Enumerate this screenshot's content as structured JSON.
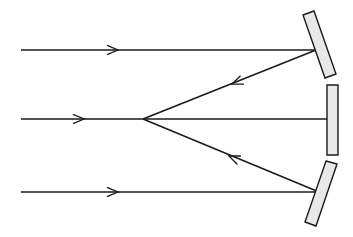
{
  "figure": {
    "background_color": "#ffffff",
    "width": 353,
    "height": 237
  },
  "style": {
    "ray_color": "#1a1a1a",
    "mirror_fill": "#e8e8e8",
    "mirror_stroke": "#1a1a1a",
    "ray_stroke_width": 1.5,
    "mirror_stroke_width": 1.4
  },
  "chart_data": {
    "type": "diagram",
    "focal_point": {
      "x": 143,
      "y": 119
    },
    "incident_rays": [
      {
        "name": "top-incident-ray",
        "x1": 21,
        "y1": 50,
        "x2": 316,
        "y2": 50,
        "arrow_at": {
          "x": 118,
          "y": 50
        },
        "direction": "right"
      },
      {
        "name": "middle-incident-ray",
        "x1": 21,
        "y1": 119,
        "x2": 327,
        "y2": 119,
        "arrow_at": {
          "x": 84,
          "y": 119
        },
        "direction": "right"
      },
      {
        "name": "bottom-incident-ray",
        "x1": 21,
        "y1": 192,
        "x2": 319,
        "y2": 192,
        "arrow_at": {
          "x": 118,
          "y": 192
        },
        "direction": "right"
      }
    ],
    "reflected_rays": [
      {
        "name": "top-reflected-ray",
        "x1": 316,
        "y1": 50,
        "x2": 143,
        "y2": 119,
        "arrow_at": {
          "x": 232,
          "y": 84
        },
        "direction": "left-down"
      },
      {
        "name": "bottom-reflected-ray",
        "x1": 319,
        "y1": 192,
        "x2": 143,
        "y2": 119,
        "arrow_at": {
          "x": 229,
          "y": 156
        },
        "direction": "left-up"
      }
    ],
    "mirror_segments": [
      {
        "name": "top-mirror-segment",
        "orientation": "tilted-left",
        "points": "303,15 314,11 336,74 325,78"
      },
      {
        "name": "middle-mirror-segment",
        "orientation": "vertical",
        "points": "327,85 338,85 338,155 327,155"
      },
      {
        "name": "bottom-mirror-segment",
        "orientation": "tilted-right",
        "points": "326,161 337,164 316,226 305,222"
      }
    ],
    "xlabel": "",
    "ylabel": "",
    "grid": false,
    "legend": false
  }
}
